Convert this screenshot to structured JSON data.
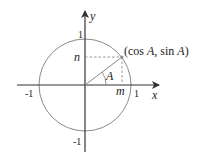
{
  "diagram": {
    "axes": {
      "x_label": "x",
      "y_label": "y"
    },
    "ticks": {
      "x_pos": "1",
      "x_neg": "-1",
      "y_pos": "1",
      "y_neg": "-1"
    },
    "point_label": "(cos A, sin A)",
    "angle_label": "A",
    "projection_x_label": "m",
    "projection_y_label": "n",
    "colors": {
      "circle": "#8a8a8a",
      "axes": "#333333",
      "radius": "#8a8a8a",
      "dashed": "#8a8a8a"
    }
  }
}
